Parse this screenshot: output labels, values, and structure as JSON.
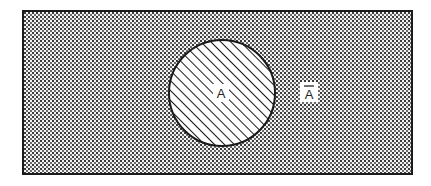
{
  "diagram": {
    "type": "venn",
    "universe": {
      "fill_pattern": "stipple",
      "color": "#222222"
    },
    "set": {
      "label": "A",
      "fill_pattern": "diagonal-hatch"
    },
    "complement": {
      "label": "A",
      "overline": true
    },
    "colors": {
      "ink": "#222222",
      "background": "#ffffff",
      "stipple_bg": "#d8d8d8"
    }
  }
}
